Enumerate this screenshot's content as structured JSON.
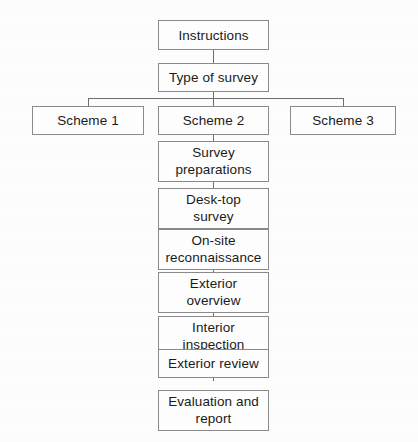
{
  "diagram": {
    "colors": {
      "border": "#8a8a8a",
      "connector": "#6f6f6f",
      "background": "#fdfdfd",
      "text": "#1a1a1a"
    },
    "nodes": [
      {
        "id": "instructions",
        "label": "Instructions",
        "x": 158,
        "y": 20,
        "w": 111,
        "h": 30,
        "lines": 1
      },
      {
        "id": "type-of-survey",
        "label": "Type of survey",
        "x": 158,
        "y": 63,
        "w": 111,
        "h": 29,
        "lines": 1
      },
      {
        "id": "scheme-1",
        "label": "Scheme 1",
        "x": 32,
        "y": 106,
        "w": 112,
        "h": 29,
        "lines": 1
      },
      {
        "id": "scheme-2",
        "label": "Scheme 2",
        "x": 158,
        "y": 106,
        "w": 111,
        "h": 29,
        "lines": 1
      },
      {
        "id": "scheme-3",
        "label": "Scheme 3",
        "x": 290,
        "y": 106,
        "w": 106,
        "h": 29,
        "lines": 1
      },
      {
        "id": "survey-preparations",
        "label": "Survey\npreparations",
        "x": 158,
        "y": 141,
        "w": 111,
        "h": 41,
        "lines": 2
      },
      {
        "id": "desk-top-survey",
        "label": "Desk-top\nsurvey",
        "x": 158,
        "y": 188,
        "w": 111,
        "h": 41,
        "lines": 2
      },
      {
        "id": "on-site-reconnaissance",
        "label": "On-site\nreconnaissance",
        "x": 158,
        "y": 229,
        "w": 111,
        "h": 41,
        "lines": 2
      },
      {
        "id": "exterior-overview",
        "label": "Exterior\noverview",
        "x": 158,
        "y": 272,
        "w": 111,
        "h": 41,
        "lines": 2
      },
      {
        "id": "interior-inspection",
        "label": "Interior\ninspection",
        "x": 158,
        "y": 316,
        "w": 111,
        "h": 41,
        "lines": 2
      },
      {
        "id": "exterior-review",
        "label": "Exterior review",
        "x": 158,
        "y": 349,
        "w": 111,
        "h": 29,
        "lines": 1
      },
      {
        "id": "evaluation-and-report",
        "label": "Evaluation and\nreport",
        "x": 158,
        "y": 390,
        "w": 111,
        "h": 41,
        "lines": 2
      }
    ],
    "connectors": {
      "vertical": [
        {
          "id": "instructions-to-type",
          "x": 213,
          "y": 50,
          "h": 13
        },
        {
          "id": "type-to-bus",
          "x": 213,
          "y": 92,
          "h": 7
        },
        {
          "id": "bus-to-scheme-1",
          "x": 88,
          "y": 98,
          "h": 8
        },
        {
          "id": "bus-to-scheme-2",
          "x": 213,
          "y": 98,
          "h": 8
        },
        {
          "id": "bus-to-scheme-3",
          "x": 343,
          "y": 98,
          "h": 8
        },
        {
          "id": "scheme-2-to-preparations",
          "x": 213,
          "y": 135,
          "h": 7
        },
        {
          "id": "preparations-to-desk-top",
          "x": 213,
          "y": 182,
          "h": 7
        },
        {
          "id": "desk-top-to-on-site",
          "x": 213,
          "y": 223,
          "h": 7
        },
        {
          "id": "on-site-to-exterior-overview",
          "x": 213,
          "y": 266,
          "h": 7
        },
        {
          "id": "exterior-overview-to-interior",
          "x": 213,
          "y": 310,
          "h": 7
        },
        {
          "id": "interior-to-exterior-review",
          "x": 213,
          "y": 343,
          "h": 7
        },
        {
          "id": "exterior-review-to-evaluation",
          "x": 213,
          "y": 367,
          "h": 14
        }
      ],
      "horizontal": [
        {
          "id": "scheme-branch-bus",
          "x": 88,
          "y": 98,
          "w": 256
        }
      ]
    }
  }
}
